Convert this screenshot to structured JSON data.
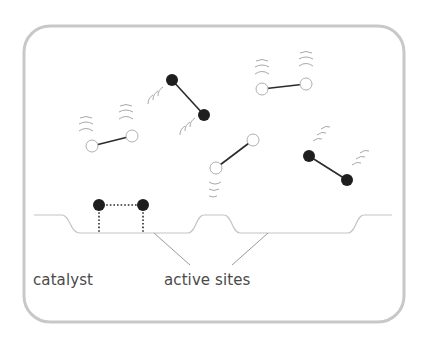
{
  "diagram": {
    "type": "heterogeneous catalysis schematic",
    "labels": {
      "catalyst": "catalyst",
      "active_sites": "active sites"
    },
    "colors": {
      "frame": "#c8c8c8",
      "surface": "#c4c4c4",
      "leader_line": "#9a9a9a",
      "bond": "#2a2a2a",
      "atom_dark": "#1e1e1e",
      "atom_light_fill": "#ffffff",
      "atom_light_stroke": "#b0b0b0",
      "vibration_arcs": "#a8a8a8",
      "text": "#4a4a4a"
    },
    "frame": {
      "x": 24,
      "y": 26,
      "width": 380,
      "height": 296,
      "radius": 26
    },
    "molecules": [
      {
        "id": "free-light-1",
        "kind": "light",
        "atoms": [
          [
            92,
            146
          ],
          [
            132,
            136
          ]
        ],
        "vibration": "above"
      },
      {
        "id": "free-dark-1",
        "kind": "dark",
        "atoms": [
          [
            172,
            80
          ],
          [
            204,
            115
          ]
        ],
        "vibration": "left"
      },
      {
        "id": "free-light-2",
        "kind": "light",
        "atoms": [
          [
            262,
            89
          ],
          [
            306,
            84
          ]
        ],
        "vibration": "above"
      },
      {
        "id": "free-light-3",
        "kind": "light",
        "atoms": [
          [
            216,
            168
          ],
          [
            253,
            140
          ]
        ],
        "vibration": "below-left"
      },
      {
        "id": "free-dark-2",
        "kind": "dark",
        "atoms": [
          [
            309,
            156
          ],
          [
            347,
            180
          ]
        ],
        "vibration": "upper-right"
      }
    ],
    "adsorbed_molecule": {
      "kind": "dark",
      "atoms": [
        [
          99,
          205
        ],
        [
          143,
          205
        ]
      ],
      "bond_style": "dotted",
      "anchors_to_surface": true
    },
    "surface": {
      "description": "catalyst surface profile with two recessed active sites",
      "active_site_count": 2
    }
  }
}
